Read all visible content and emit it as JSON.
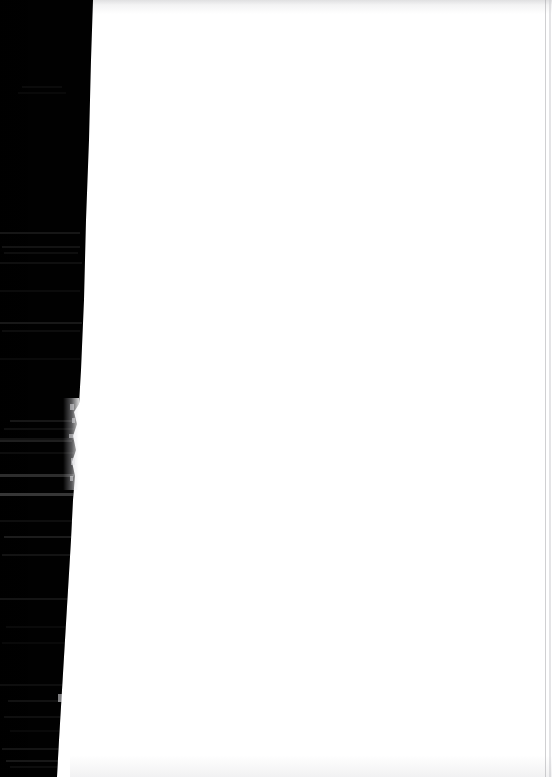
{
  "document": {
    "kind": "scanned-page",
    "page_label": "blank recto page",
    "title": "Scanned book page — blank leaf with shadowed gutter",
    "width_px": 552,
    "height_px": 777,
    "visible_text": "",
    "notes": "No legible printed text is rendered in the pixels; the left strip is an underexposed binding gutter showing only faint, illegible line traces."
  },
  "colors": {
    "page_background": "#ffffff",
    "gutter_shadow": "#010101",
    "ink_trace": "#ffffff",
    "scan_edge_rule": "#96969b",
    "top_haze": "#b4b4b9"
  },
  "regions": {
    "gutter": {
      "name": "Shadowed gutter strip",
      "edge_top_x": 93,
      "edge_bottom_x": 57,
      "has_frayed_edge": true,
      "frayed_edge_y_range": [
        398,
        490
      ]
    },
    "leaf": {
      "name": "Blank page leaf",
      "left_x": 93,
      "right_x": 552,
      "is_blank": true
    }
  },
  "ink_traces": [
    {
      "top": 86,
      "left": 22,
      "width": 40,
      "opacity": 0.045
    },
    {
      "top": 92,
      "left": 18,
      "width": 48,
      "opacity": 0.035
    },
    {
      "top": 232,
      "left": 0,
      "width": 80,
      "opacity": 0.085
    },
    {
      "top": 246,
      "left": 2,
      "width": 78,
      "opacity": 0.075
    },
    {
      "top": 252,
      "left": 4,
      "width": 74,
      "opacity": 0.055
    },
    {
      "top": 262,
      "left": 0,
      "width": 82,
      "opacity": 0.06
    },
    {
      "top": 290,
      "left": 0,
      "width": 80,
      "opacity": 0.045
    },
    {
      "top": 322,
      "left": 0,
      "width": 82,
      "opacity": 0.095
    },
    {
      "top": 330,
      "left": 2,
      "width": 78,
      "opacity": 0.05
    },
    {
      "top": 358,
      "left": 0,
      "width": 80,
      "opacity": 0.04
    },
    {
      "top": 420,
      "left": 10,
      "width": 62,
      "opacity": 0.09
    },
    {
      "top": 428,
      "left": 4,
      "width": 70,
      "opacity": 0.06
    },
    {
      "top": 438,
      "left": 0,
      "width": 76,
      "opacity": 0.07
    },
    {
      "top": 452,
      "left": 0,
      "width": 74,
      "opacity": 0.05
    },
    {
      "top": 520,
      "left": 0,
      "width": 74,
      "opacity": 0.055
    },
    {
      "top": 536,
      "left": 4,
      "width": 68,
      "opacity": 0.11
    },
    {
      "top": 554,
      "left": 2,
      "width": 70,
      "opacity": 0.075
    },
    {
      "top": 598,
      "left": 0,
      "width": 72,
      "opacity": 0.08
    },
    {
      "top": 626,
      "left": 6,
      "width": 62,
      "opacity": 0.04
    },
    {
      "top": 642,
      "left": 2,
      "width": 66,
      "opacity": 0.035
    },
    {
      "top": 684,
      "left": 0,
      "width": 68,
      "opacity": 0.055
    },
    {
      "top": 700,
      "left": 8,
      "width": 56,
      "opacity": 0.07
    },
    {
      "top": 716,
      "left": 4,
      "width": 60,
      "opacity": 0.06
    },
    {
      "top": 730,
      "left": 10,
      "width": 50,
      "opacity": 0.035
    },
    {
      "top": 748,
      "left": 2,
      "width": 60,
      "opacity": 0.08
    },
    {
      "top": 760,
      "left": 6,
      "width": 54,
      "opacity": 0.095
    },
    {
      "top": 766,
      "left": 10,
      "width": 48,
      "opacity": 0.05
    }
  ],
  "rules": [
    {
      "top": 474,
      "left": 0,
      "width": 74,
      "height": 3,
      "opacity": 0.175
    },
    {
      "top": 493,
      "left": 0,
      "width": 74,
      "height": 3,
      "opacity": 0.21
    },
    {
      "top": 440,
      "left": 0,
      "width": 72,
      "height": 2,
      "opacity": 0.12
    }
  ],
  "edge_nicks": [
    {
      "top": 404,
      "left": 70,
      "width": 4,
      "height": 6
    },
    {
      "top": 418,
      "left": 72,
      "width": 3,
      "height": 5
    },
    {
      "top": 434,
      "left": 69,
      "width": 5,
      "height": 4
    },
    {
      "top": 458,
      "left": 71,
      "width": 4,
      "height": 7
    },
    {
      "top": 476,
      "left": 70,
      "width": 3,
      "height": 5
    },
    {
      "top": 694,
      "left": 58,
      "width": 4,
      "height": 8
    }
  ]
}
